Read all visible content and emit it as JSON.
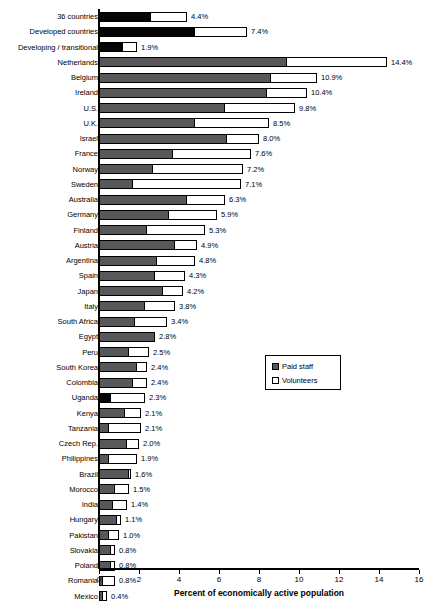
{
  "chart_data": {
    "type": "bar",
    "orientation": "horizontal",
    "stacked": true,
    "title": "",
    "xlabel": "Percent of economically active population",
    "ylabel": "",
    "xlim": [
      0,
      16
    ],
    "xticks": [
      0,
      2,
      4,
      6,
      8,
      10,
      12,
      14,
      16
    ],
    "xtick_labels": [
      "0",
      "2",
      "4",
      "6",
      "8",
      "10",
      "12",
      "14",
      "16"
    ],
    "grid": false,
    "legend_position": "center-right",
    "series": [
      {
        "name": "Paid staff",
        "color": "#58585a"
      },
      {
        "name": "Volunteers",
        "color": "#ffffff"
      }
    ],
    "categories": [
      "36 countries",
      "Developed countries",
      "Developing / transitional",
      "Netherlands",
      "Belgium",
      "Ireland",
      "U.S.",
      "U.K.",
      "Israel",
      "France",
      "Norway",
      "Sweden",
      "Australia",
      "Germany",
      "Finland",
      "Austria",
      "Argentina",
      "Spain",
      "Japan",
      "Italy",
      "South Africa",
      "Egypt",
      "Peru",
      "South Korea",
      "Colombia",
      "Uganda",
      "Kenya",
      "Tanzania",
      "Czech Rep.",
      "Philippines",
      "Brazil",
      "Morocco",
      "India",
      "Hungary",
      "Pakistan",
      "Slovakia",
      "Poland",
      "Romania",
      "Mexico"
    ],
    "rows": [
      {
        "label": "36 countries",
        "paid": 2.6,
        "volunteers": 1.8,
        "total": 4.4,
        "total_label": "4.4%",
        "emphasis": true
      },
      {
        "label": "Developed countries",
        "paid": 4.8,
        "volunteers": 2.6,
        "total": 7.4,
        "total_label": "7.4%",
        "emphasis": true
      },
      {
        "label": "Developing / transitional",
        "paid": 1.2,
        "volunteers": 0.7,
        "total": 1.9,
        "total_label": "1.9%",
        "emphasis": true
      },
      {
        "label": "Netherlands",
        "paid": 9.4,
        "volunteers": 5.0,
        "total": 14.4,
        "total_label": "14.4%",
        "emphasis": false
      },
      {
        "label": "Belgium",
        "paid": 8.6,
        "volunteers": 2.3,
        "total": 10.9,
        "total_label": "10.9%",
        "emphasis": false
      },
      {
        "label": "Ireland",
        "paid": 8.4,
        "volunteers": 2.0,
        "total": 10.4,
        "total_label": "10.4%",
        "emphasis": false
      },
      {
        "label": "U.S.",
        "paid": 6.3,
        "volunteers": 3.5,
        "total": 9.8,
        "total_label": "9.8%",
        "emphasis": false
      },
      {
        "label": "U.K.",
        "paid": 4.8,
        "volunteers": 3.7,
        "total": 8.5,
        "total_label": "8.5%",
        "emphasis": false
      },
      {
        "label": "Israel",
        "paid": 6.4,
        "volunteers": 1.6,
        "total": 8.0,
        "total_label": "8.0%",
        "emphasis": false
      },
      {
        "label": "France",
        "paid": 3.7,
        "volunteers": 3.9,
        "total": 7.6,
        "total_label": "7.6%",
        "emphasis": false
      },
      {
        "label": "Norway",
        "paid": 2.7,
        "volunteers": 4.5,
        "total": 7.2,
        "total_label": "7.2%",
        "emphasis": false
      },
      {
        "label": "Sweden",
        "paid": 1.7,
        "volunteers": 5.4,
        "total": 7.1,
        "total_label": "7.1%",
        "emphasis": false
      },
      {
        "label": "Australia",
        "paid": 4.4,
        "volunteers": 1.9,
        "total": 6.3,
        "total_label": "6.3%",
        "emphasis": false
      },
      {
        "label": "Germany",
        "paid": 3.5,
        "volunteers": 2.4,
        "total": 5.9,
        "total_label": "5.9%",
        "emphasis": false
      },
      {
        "label": "Finland",
        "paid": 2.4,
        "volunteers": 2.9,
        "total": 5.3,
        "total_label": "5.3%",
        "emphasis": false
      },
      {
        "label": "Austria",
        "paid": 3.8,
        "volunteers": 1.1,
        "total": 4.9,
        "total_label": "4.9%",
        "emphasis": false
      },
      {
        "label": "Argentina",
        "paid": 2.9,
        "volunteers": 1.9,
        "total": 4.8,
        "total_label": "4.8%",
        "emphasis": false
      },
      {
        "label": "Spain",
        "paid": 2.8,
        "volunteers": 1.5,
        "total": 4.3,
        "total_label": "4.3%",
        "emphasis": false
      },
      {
        "label": "Japan",
        "paid": 3.2,
        "volunteers": 1.0,
        "total": 4.2,
        "total_label": "4.2%",
        "emphasis": false
      },
      {
        "label": "Italy",
        "paid": 2.3,
        "volunteers": 1.5,
        "total": 3.8,
        "total_label": "3.8%",
        "emphasis": false
      },
      {
        "label": "South Africa",
        "paid": 1.8,
        "volunteers": 1.6,
        "total": 3.4,
        "total_label": "3.4%",
        "emphasis": false
      },
      {
        "label": "Egypt",
        "paid": 2.8,
        "volunteers": 0.0,
        "total": 2.8,
        "total_label": "2.8%",
        "emphasis": false
      },
      {
        "label": "Peru",
        "paid": 1.5,
        "volunteers": 1.0,
        "total": 2.5,
        "total_label": "2.5%",
        "emphasis": false
      },
      {
        "label": "South Korea",
        "paid": 1.9,
        "volunteers": 0.5,
        "total": 2.4,
        "total_label": "2.4%",
        "emphasis": false
      },
      {
        "label": "Colombia",
        "paid": 1.7,
        "volunteers": 0.7,
        "total": 2.4,
        "total_label": "2.4%",
        "emphasis": false
      },
      {
        "label": "Uganda",
        "paid": 0.6,
        "volunteers": 1.7,
        "total": 2.3,
        "total_label": "2.3%",
        "emphasis": true
      },
      {
        "label": "Kenya",
        "paid": 1.3,
        "volunteers": 0.8,
        "total": 2.1,
        "total_label": "2.1%",
        "emphasis": false
      },
      {
        "label": "Tanzania",
        "paid": 0.5,
        "volunteers": 1.6,
        "total": 2.1,
        "total_label": "2.1%",
        "emphasis": false
      },
      {
        "label": "Czech Rep.",
        "paid": 1.4,
        "volunteers": 0.6,
        "total": 2.0,
        "total_label": "2.0%",
        "emphasis": false
      },
      {
        "label": "Philippines",
        "paid": 0.5,
        "volunteers": 1.4,
        "total": 1.9,
        "total_label": "1.9%",
        "emphasis": false
      },
      {
        "label": "Brazil",
        "paid": 1.5,
        "volunteers": 0.1,
        "total": 1.6,
        "total_label": "1.6%",
        "emphasis": false
      },
      {
        "label": "Morocco",
        "paid": 0.8,
        "volunteers": 0.7,
        "total": 1.5,
        "total_label": "1.5%",
        "emphasis": false
      },
      {
        "label": "India",
        "paid": 0.7,
        "volunteers": 0.7,
        "total": 1.4,
        "total_label": "1.4%",
        "emphasis": false
      },
      {
        "label": "Hungary",
        "paid": 0.9,
        "volunteers": 0.2,
        "total": 1.1,
        "total_label": "1.1%",
        "emphasis": false
      },
      {
        "label": "Pakistan",
        "paid": 0.5,
        "volunteers": 0.5,
        "total": 1.0,
        "total_label": "1.0%",
        "emphasis": false
      },
      {
        "label": "Slovakia",
        "paid": 0.6,
        "volunteers": 0.2,
        "total": 0.8,
        "total_label": "0.8%",
        "emphasis": false
      },
      {
        "label": "Poland",
        "paid": 0.6,
        "volunteers": 0.2,
        "total": 0.8,
        "total_label": "0.8%",
        "emphasis": false
      },
      {
        "label": "Romania",
        "paid": 0.2,
        "volunteers": 0.6,
        "total": 0.8,
        "total_label": "0.8%",
        "emphasis": false
      },
      {
        "label": "Mexico",
        "paid": 0.2,
        "volunteers": 0.2,
        "total": 0.4,
        "total_label": "0.4%",
        "emphasis": false
      }
    ]
  },
  "legend": {
    "items": [
      {
        "label": "Paid staff",
        "swatch": "paid"
      },
      {
        "label": "Volunteers",
        "swatch": "vol"
      }
    ]
  },
  "axis": {
    "title": "Percent of economically active population"
  },
  "source_note": ""
}
